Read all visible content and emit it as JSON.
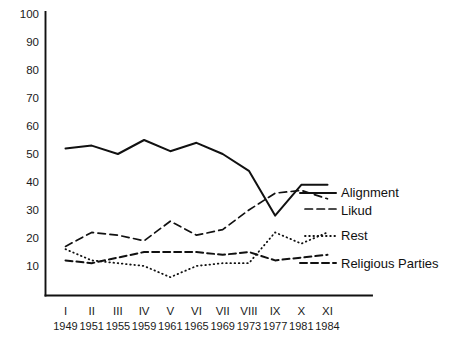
{
  "chart_data": {
    "type": "line",
    "title": "",
    "xlabel": "",
    "ylabel": "",
    "ylim": [
      0,
      100
    ],
    "yticks": [
      10,
      20,
      30,
      40,
      50,
      60,
      70,
      80,
      90,
      100
    ],
    "grid": false,
    "legend_position": "right",
    "categories": [
      "I",
      "II",
      "III",
      "IV",
      "V",
      "VI",
      "VII",
      "VIII",
      "IX",
      "X",
      "XI"
    ],
    "x_secondary": [
      "1949",
      "1951",
      "1955",
      "1959",
      "1961",
      "1965",
      "1969",
      "1973",
      "1977",
      "1981",
      "1984"
    ],
    "series": [
      {
        "name": "Alignment",
        "style": "solid",
        "values": [
          52,
          53,
          50,
          55,
          51,
          54,
          50,
          44,
          28,
          39,
          39
        ]
      },
      {
        "name": "Likud",
        "style": "dashed-long",
        "values": [
          17,
          22,
          21,
          19,
          26,
          21,
          23,
          30,
          36,
          37,
          34
        ]
      },
      {
        "name": "Rest",
        "style": "dotted",
        "values": [
          16,
          12,
          11,
          10,
          6,
          10,
          11,
          11,
          22,
          18,
          22
        ]
      },
      {
        "name": "Religious Parties",
        "style": "dashed",
        "values": [
          12,
          11,
          13,
          15,
          15,
          15,
          14,
          15,
          12,
          13,
          14
        ]
      }
    ]
  },
  "legend": {
    "entries": [
      {
        "label": "Alignment"
      },
      {
        "label": "Likud"
      },
      {
        "label": "Rest"
      },
      {
        "label": "Religious Parties"
      }
    ]
  },
  "axis": {
    "y_axis_name": "percentage-of-seats",
    "x_axis_name": "knesset-election"
  }
}
